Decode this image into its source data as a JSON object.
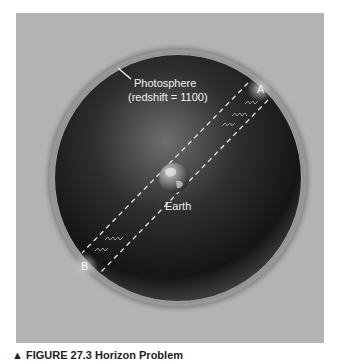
{
  "diagram": {
    "photosphere_label_line1": "Photosphere",
    "photosphere_label_line2": "(redshift = 1100)",
    "earth_label": "Earth",
    "point_a_label": "A",
    "point_b_label": "B",
    "colors": {
      "background_panel": "#b3b3b3",
      "sphere_dark": "#1a1a1a",
      "sphere_light": "#6a6a6a",
      "label_text": "#f2f2f2",
      "dashed_lines": "#e8e8e8"
    }
  },
  "caption": {
    "text": "▲ FIGURE 27.3 Horizon Problem"
  }
}
